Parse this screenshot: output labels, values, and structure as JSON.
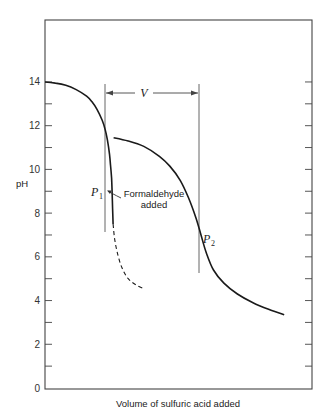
{
  "chart_data": {
    "type": "line",
    "title": "",
    "xlabel": "Volume of sulfuric acid added",
    "ylabel": "pH",
    "ylim": [
      0,
      16.8
    ],
    "yticks": [
      0,
      2,
      4,
      6,
      8,
      10,
      12,
      14
    ],
    "yticks_minor": [
      1,
      3,
      5,
      7,
      9,
      11,
      13
    ],
    "xticks": [],
    "grid": false,
    "legend": null,
    "series": [
      {
        "name": "Titration before formaldehyde",
        "style": "solid",
        "x": [
          0,
          0.1,
          0.2,
          0.3,
          0.4,
          0.45,
          0.5,
          0.55,
          0.58,
          0.6,
          0.62,
          0.63,
          0.64,
          0.645,
          0.65,
          0.655
        ],
        "y": [
          14.0,
          13.95,
          13.85,
          13.65,
          13.35,
          13.1,
          12.75,
          12.25,
          11.8,
          11.35,
          10.7,
          10.2,
          9.6,
          9.0,
          8.2,
          7.5
        ]
      },
      {
        "name": "Continuation without formaldehyde (hypothetical)",
        "style": "dashed",
        "x": [
          0.655,
          0.67,
          0.7,
          0.74,
          0.8,
          0.88,
          0.95
        ],
        "y": [
          7.5,
          6.8,
          6.1,
          5.5,
          5.0,
          4.7,
          4.55
        ]
      },
      {
        "name": "Titration after formaldehyde added",
        "style": "solid",
        "x": [
          0.66,
          0.8,
          0.95,
          1.1,
          1.2,
          1.3,
          1.38,
          1.45,
          1.5,
          1.55,
          1.62,
          1.72,
          1.85,
          2.0,
          2.15,
          2.3
        ],
        "y": [
          11.45,
          11.3,
          11.05,
          10.6,
          10.15,
          9.5,
          8.7,
          7.8,
          7.0,
          6.2,
          5.4,
          4.8,
          4.3,
          3.9,
          3.6,
          3.35
        ]
      }
    ],
    "annotations": [
      {
        "text": "P1",
        "label": "P",
        "subscript": "1",
        "x": 0.645,
        "y": 9.0
      },
      {
        "text": "Formaldehyde added",
        "line1": "Formaldehyde",
        "line2": "added",
        "points_to": "P1"
      },
      {
        "text": "P2",
        "label": "P",
        "subscript": "2",
        "x": 1.5,
        "y": 7.0
      },
      {
        "text": "V",
        "type": "double-arrow",
        "from_x": 0.65,
        "to_x": 1.5,
        "y": 13.6
      },
      {
        "type": "vertical-line",
        "x": 0.65,
        "y_from": 6.9,
        "y_to": 13.9
      },
      {
        "type": "vertical-line",
        "x": 1.5,
        "y_from": 5.3,
        "y_to": 13.9
      }
    ]
  }
}
